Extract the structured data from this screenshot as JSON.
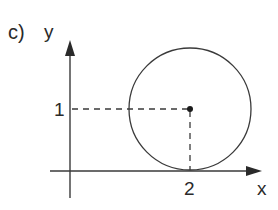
{
  "figure": {
    "part_label": "c)",
    "axes": {
      "x_label": "x",
      "y_label": "y"
    },
    "ticks": {
      "x_tick_label": "2",
      "y_tick_label": "1"
    },
    "circle": {
      "center": [
        2,
        1
      ],
      "radius": 1,
      "tangent_to": "x-axis"
    },
    "guides": {
      "horizontal_dashed": "from y-axis at y=1 to center",
      "vertical_dashed": "from center down to x-axis at x=2"
    },
    "colors": {
      "stroke": "#3a3a3a",
      "background": "#ffffff"
    }
  }
}
